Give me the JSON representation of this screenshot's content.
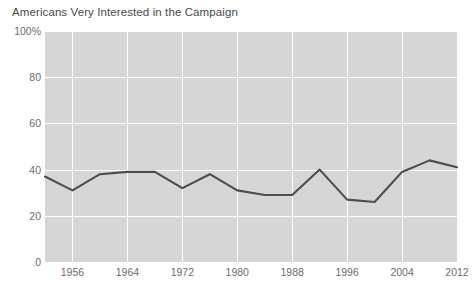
{
  "chart_data": {
    "type": "line",
    "title": "Americans Very Interested in the Campaign",
    "xlabel": "",
    "ylabel": "",
    "ylim": [
      0,
      100
    ],
    "xlim": [
      1952,
      2012
    ],
    "grid": true,
    "legend": "none",
    "y_ticks": [
      {
        "value": 100,
        "label": "100%"
      },
      {
        "value": 80,
        "label": "80"
      },
      {
        "value": 60,
        "label": "60"
      },
      {
        "value": 40,
        "label": "40"
      },
      {
        "value": 20,
        "label": "20"
      },
      {
        "value": 0,
        "label": "0"
      }
    ],
    "x_ticks": [
      {
        "value": 1956,
        "label": "1956"
      },
      {
        "value": 1964,
        "label": "1964"
      },
      {
        "value": 1972,
        "label": "1972"
      },
      {
        "value": 1980,
        "label": "1980"
      },
      {
        "value": 1988,
        "label": "1988"
      },
      {
        "value": 1996,
        "label": "1996"
      },
      {
        "value": 2004,
        "label": "2004"
      },
      {
        "value": 2012,
        "label": "2012"
      }
    ],
    "x": [
      1952,
      1956,
      1960,
      1964,
      1968,
      1972,
      1976,
      1980,
      1984,
      1988,
      1992,
      1996,
      2000,
      2004,
      2008,
      2012
    ],
    "values": [
      37,
      31,
      38,
      39,
      39,
      32,
      38,
      31,
      29,
      29,
      40,
      27,
      26,
      39,
      44,
      41
    ],
    "series": [
      {
        "name": "Very interested in the campaign",
        "color": "#4d4d4d",
        "values": [
          37,
          31,
          38,
          39,
          39,
          32,
          38,
          31,
          29,
          29,
          40,
          27,
          26,
          39,
          44,
          41
        ]
      }
    ],
    "colors": {
      "plot_background": "#d6d6d6",
      "gridline": "#ffffff",
      "line": "#4d4d4d",
      "text": "#6d6d6d",
      "title_text": "#4a4a4a",
      "page_background": "#ffffff"
    }
  }
}
